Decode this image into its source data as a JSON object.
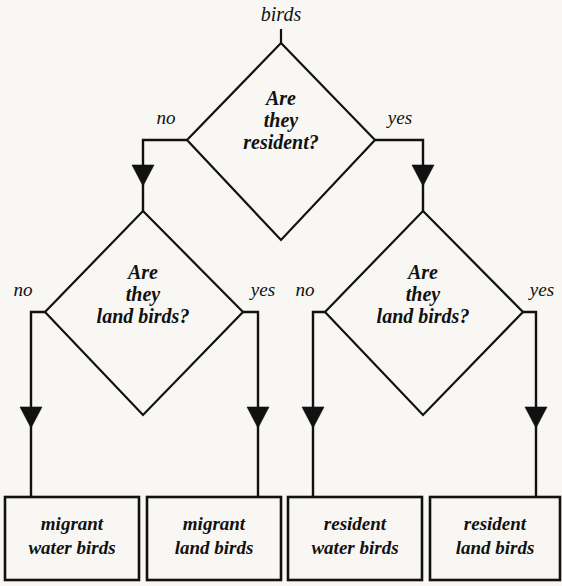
{
  "diagram": {
    "type": "decision-tree-flowchart",
    "root_label": "birds",
    "decisions": [
      {
        "id": "d1",
        "line1": "Are",
        "line2": "they",
        "line3": "resident?",
        "no_label": "no",
        "yes_label": "yes"
      },
      {
        "id": "d2",
        "line1": "Are",
        "line2": "they",
        "line3": "land birds?",
        "no_label": "no",
        "yes_label": "yes"
      },
      {
        "id": "d3",
        "line1": "Are",
        "line2": "they",
        "line3": "land birds?",
        "no_label": "no",
        "yes_label": "yes"
      }
    ],
    "outcomes": [
      {
        "id": "o1",
        "line1": "migrant",
        "line2": "water birds"
      },
      {
        "id": "o2",
        "line1": "migrant",
        "line2": "land birds"
      },
      {
        "id": "o3",
        "line1": "resident",
        "line2": "water birds"
      },
      {
        "id": "o4",
        "line1": "resident",
        "line2": "land birds"
      }
    ],
    "colors": {
      "background": "#f8f7f4",
      "stroke": "#111111",
      "text": "#111111",
      "shape_fill": "#f8f7f4"
    }
  }
}
